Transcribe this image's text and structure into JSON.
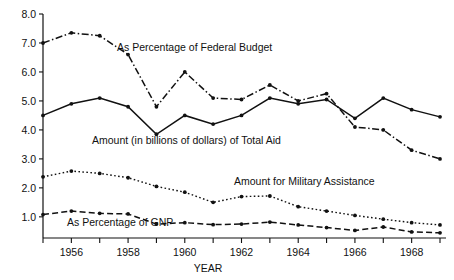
{
  "chart_data": {
    "type": "line",
    "title": "",
    "xlabel": "YEAR",
    "ylabel": "",
    "xlim": [
      1955,
      1969
    ],
    "ylim": [
      0.35,
      8.0
    ],
    "grid": false,
    "legend_position": "inline-annotations",
    "x": [
      1955,
      1956,
      1957,
      1958,
      1959,
      1960,
      1961,
      1962,
      1963,
      1964,
      1965,
      1966,
      1967,
      1968,
      1969
    ],
    "xticklabels": [
      "",
      "1956",
      "",
      "1958",
      "",
      "1960",
      "",
      "1962",
      "",
      "1964",
      "",
      "1966",
      "",
      "1968",
      ""
    ],
    "yticks": [
      1.0,
      2.0,
      3.0,
      4.0,
      5.0,
      6.0,
      7.0,
      8.0
    ],
    "yticklabels": [
      "1.0",
      "2.0",
      "3.0",
      "4.0",
      "5.0",
      "6.0",
      "7.0",
      "8.0"
    ],
    "series": [
      {
        "name": "As Percentage of Federal Budget",
        "style": "dash-dot",
        "values": [
          7.0,
          7.35,
          7.25,
          6.6,
          4.8,
          6.0,
          5.1,
          5.05,
          5.55,
          5.0,
          5.25,
          4.1,
          4.0,
          3.3,
          3.0
        ]
      },
      {
        "name": "Amount (in billions of dollars) of Total Aid",
        "style": "solid",
        "values": [
          4.5,
          4.9,
          5.1,
          4.8,
          3.85,
          4.5,
          4.2,
          4.5,
          5.1,
          4.9,
          5.05,
          4.4,
          5.1,
          4.7,
          4.45
        ]
      },
      {
        "name": "Amount for Military Assistance",
        "style": "dotted",
        "values": [
          2.38,
          2.58,
          2.5,
          2.35,
          2.05,
          1.85,
          1.5,
          1.7,
          1.72,
          1.35,
          1.2,
          1.05,
          0.92,
          0.8,
          0.72
        ]
      },
      {
        "name": "As Percentage of GNP",
        "style": "dashed",
        "values": [
          1.08,
          1.2,
          1.12,
          1.1,
          0.75,
          0.8,
          0.73,
          0.75,
          0.82,
          0.72,
          0.63,
          0.53,
          0.65,
          0.48,
          0.45
        ]
      }
    ],
    "annotations": [
      {
        "text": "As Percentage of Federal Budget",
        "x": 117,
        "y": 51
      },
      {
        "text": "Amount (in billions of dollars) of Total Aid",
        "x": 92,
        "y": 144
      },
      {
        "text": "Amount for Military Assistance",
        "x": 234,
        "y": 185
      },
      {
        "text": "As Percentage of GNP",
        "x": 67,
        "y": 226
      }
    ],
    "colors": {
      "ink": "#111111",
      "background": "#ffffff"
    }
  }
}
